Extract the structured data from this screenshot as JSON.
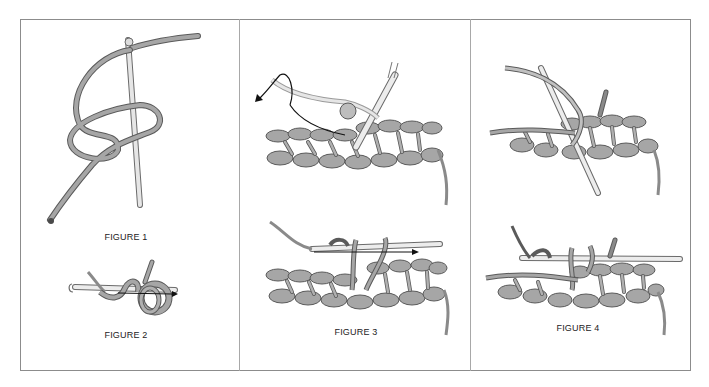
{
  "figures": [
    {
      "id": 1,
      "label": "FIGURE 1",
      "description": "slip knot loop on crochet hook"
    },
    {
      "id": 2,
      "label": "FIGURE 2",
      "description": "yarn wrapped around hook, arrow pulling through"
    },
    {
      "id": 3,
      "label": "FIGURE 3",
      "description": "hook inserted into crochet row, yarn over and pull through"
    },
    {
      "id": 4,
      "label": "FIGURE 4",
      "description": "drawing loops through stitches on hook"
    }
  ],
  "colors": {
    "frame_border": "#8c8c8c",
    "divider": "#a8a8a8",
    "yarn_fill": "#a6a6a6",
    "yarn_stroke": "#5a5a5a",
    "hook_fill": "#e6e6e6",
    "arrow": "#111111",
    "label_text": "#222222"
  }
}
